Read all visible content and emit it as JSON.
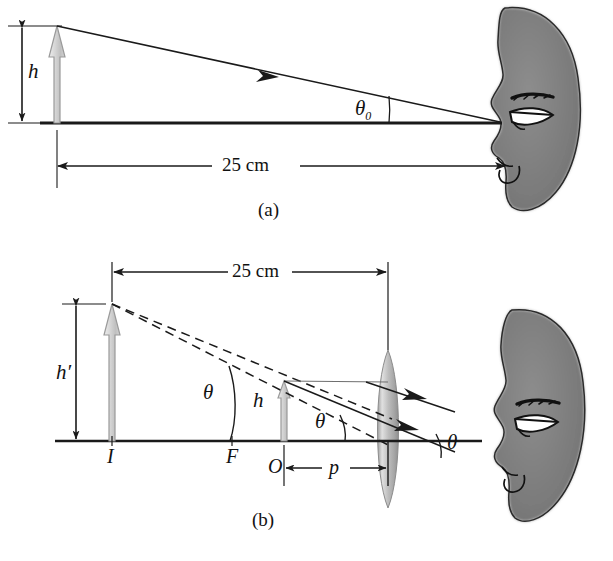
{
  "figure": {
    "type": "optics-ray-diagram"
  },
  "panel_a": {
    "caption": "(a)",
    "object_height_label": "h",
    "angle_label": "θ0",
    "angle_label_base": "θ",
    "angle_label_sub": "0",
    "distance_label": "25 cm",
    "eye_icon": "human-head-profile"
  },
  "panel_b": {
    "caption": "(b)",
    "image_height_label": "h′",
    "object_height_label": "h",
    "point_image_label": "I",
    "point_focus_label": "F",
    "point_object_label": "O",
    "object_distance_label": "p",
    "distance_label": "25 cm",
    "angle_label_1": "θ",
    "angle_label_2": "θ",
    "angle_label_3": "θ",
    "lens_icon": "biconvex-lens",
    "eye_icon": "human-head-profile"
  },
  "colors": {
    "ink": "#1a1a1a",
    "arrow_fill_light": "#d9d9d9",
    "arrow_fill_mid": "#c2c2c2",
    "arrow_stroke": "#8a8a8a",
    "lens_fill": "#b5b5b5",
    "head_fill": "#7a7a7a",
    "background": "#ffffff"
  }
}
